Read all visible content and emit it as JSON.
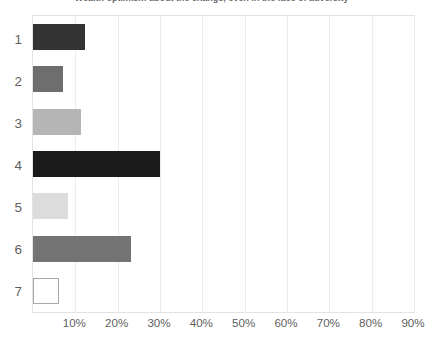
{
  "chart_data": {
    "type": "bar",
    "orientation": "horizontal",
    "title": "Wealth optimism about the change, even in the face of adversity",
    "xlabel": "",
    "ylabel": "",
    "categories": [
      "1",
      "2",
      "3",
      "4",
      "5",
      "6",
      "7"
    ],
    "values": [
      12.2,
      7.1,
      11.3,
      29.9,
      8.2,
      23.1,
      6.1
    ],
    "value_format": "percent",
    "xlim": [
      0,
      90
    ],
    "xticks": [
      10,
      20,
      30,
      40,
      50,
      60,
      70,
      80,
      90
    ],
    "xtick_labels": [
      "10%",
      "20%",
      "30%",
      "40%",
      "50%",
      "60%",
      "70%",
      "80%",
      "90%"
    ],
    "grid": true,
    "grid_axis": "x",
    "legend": false,
    "bar_colors": [
      "#333333",
      "#6e6e6e",
      "#b5b5b5",
      "#1a1a1a",
      "#dcdcdc",
      "#737373",
      "#ffffff"
    ],
    "bar_border_colors": [
      "#333333",
      "#6e6e6e",
      "#b5b5b5",
      "#1a1a1a",
      "#dcdcdc",
      "#737373",
      "#a8a8a8"
    ],
    "axis_color": "#e3e3e3",
    "grid_color": "#ededed",
    "text_color": "#5f5f5f"
  }
}
